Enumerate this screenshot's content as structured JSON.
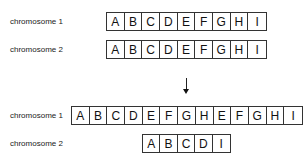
{
  "before": {
    "chromosome1": {
      "label": "chromosome 1",
      "genes": [
        "A",
        "B",
        "C",
        "D",
        "E",
        "F",
        "G",
        "H",
        "I"
      ]
    },
    "chromosome2": {
      "label": "chromosome 2",
      "genes": [
        "A",
        "B",
        "C",
        "D",
        "E",
        "F",
        "G",
        "H",
        "I"
      ]
    }
  },
  "after": {
    "chromosome1": {
      "label": "chromosome 1",
      "genes": [
        "A",
        "B",
        "C",
        "D",
        "E",
        "F",
        "G",
        "H",
        "E",
        "F",
        "G",
        "H",
        "I"
      ]
    },
    "chromosome2": {
      "label": "chromosome 2",
      "genes": [
        "A",
        "B",
        "C",
        "D",
        "I"
      ]
    }
  },
  "arrow": {
    "direction": "down"
  }
}
